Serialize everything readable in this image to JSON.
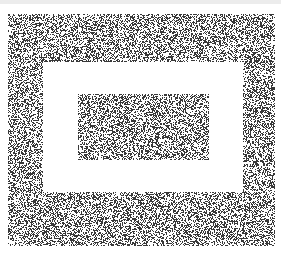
{
  "image": {
    "description": "Random-dot pattern: outer noise field, white rectangular frame, inner noise rectangle",
    "width": 281,
    "height": 256,
    "background": "#ffffff",
    "top_band_color": "#ececec",
    "dot_color": "#000000",
    "regions": {
      "outer_noise": {
        "x": 8,
        "y": 14,
        "w": 267,
        "h": 232
      },
      "white_frame": {
        "x": 43,
        "y": 62,
        "w": 200,
        "h": 130
      },
      "inner_noise": {
        "x": 78,
        "y": 94,
        "w": 131,
        "h": 66
      }
    },
    "density": 0.42,
    "seed": 12345
  }
}
